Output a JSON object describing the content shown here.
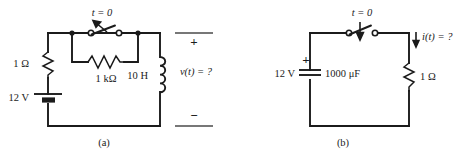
{
  "figure": {
    "kind": "circuit-schematic-figure",
    "background_color": "#ffffff",
    "ink_color": "#1b1b1b",
    "panels": [
      {
        "caption": "(a)",
        "switch_label": "t = 0",
        "switch_state": "open",
        "switch_arrow_direction": "up-left",
        "components": [
          {
            "name": "resistor-1-ohm",
            "label": "1 Ω",
            "orientation": "vertical"
          },
          {
            "name": "voltage-source-12v",
            "label": "12 V",
            "symbol": "battery"
          },
          {
            "name": "resistor-1-kilohm",
            "label": "1 kΩ",
            "orientation": "horizontal"
          },
          {
            "name": "inductor-10-henry",
            "label": "10 H",
            "orientation": "vertical"
          }
        ],
        "output_label": "v(t) = ?",
        "terminal_plus": "+",
        "terminal_minus": "−"
      },
      {
        "caption": "(b)",
        "switch_label": "t = 0",
        "switch_state": "open",
        "switch_arrow_direction": "down",
        "components": [
          {
            "name": "voltage-source-12v",
            "label": "12 V",
            "symbol": "capacitor-plates"
          },
          {
            "name": "capacitor-1000-microfarad",
            "label": "1000 μF",
            "polarity_sign": "+"
          },
          {
            "name": "resistor-1-ohm",
            "label": "1 Ω",
            "orientation": "vertical"
          }
        ],
        "output_label": "i(t) = ?",
        "current_arrow_direction": "down"
      }
    ]
  },
  "panel_a": {
    "caption": "(a)",
    "switch_label": "t = 0",
    "r1_label": "1 Ω",
    "source_label": "12 V",
    "rk_label": "1 kΩ",
    "inductor_label": "10 H",
    "output_label": "v(t) = ?",
    "plus_sign": "+",
    "minus_sign": "−"
  },
  "panel_b": {
    "caption": "(b)",
    "switch_label": "t = 0",
    "source_label": "12 V",
    "cap_label": "1000 μF",
    "cap_plus_sign": "+",
    "r1_label": "1 Ω",
    "output_label": "i(t) = ?"
  }
}
